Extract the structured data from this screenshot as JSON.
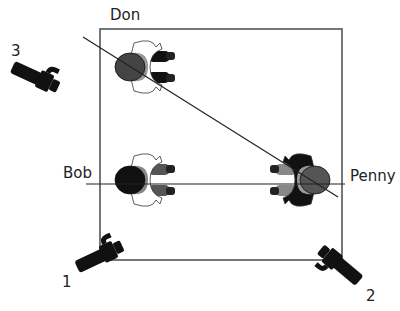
{
  "diagram": {
    "type": "camera-blocking-floorplan",
    "stage": {
      "x": 100,
      "y": 29,
      "width": 242,
      "height": 231,
      "stroke": "#555555"
    },
    "actors": [
      {
        "name": "Don",
        "label_x": 110,
        "label_y": 8,
        "cx": 140,
        "cy": 67,
        "facing": "right",
        "hair": "#444444",
        "shirt": "#ffffff",
        "pants": "#111111",
        "shoulder": "#999999"
      },
      {
        "name": "Bob",
        "label_x": 63,
        "label_y": 166,
        "cx": 140,
        "cy": 180,
        "facing": "right",
        "hair": "#111111",
        "shirt": "#ffffff",
        "pants": "#555555",
        "shoulder": "#888888"
      },
      {
        "name": "Penny",
        "label_x": 350,
        "label_y": 169,
        "cx": 305,
        "cy": 180,
        "facing": "left",
        "hair": "#555555",
        "shirt": "#111111",
        "pants": "#888888",
        "shoulder": "#999999"
      }
    ],
    "sightlines": [
      {
        "name": "don-penny-line",
        "x1": 83,
        "y1": 37,
        "x2": 338,
        "y2": 197
      },
      {
        "name": "bob-penny-line",
        "x1": 86,
        "y1": 184,
        "x2": 345,
        "y2": 184
      }
    ],
    "cameras": [
      {
        "number": "1",
        "label_x": 62,
        "label_y": 275,
        "cx": 104,
        "cy": 254,
        "angle": -25
      },
      {
        "number": "2",
        "label_x": 366,
        "label_y": 289,
        "cx": 336,
        "cy": 262,
        "angle": -140
      },
      {
        "number": "3",
        "label_x": 11,
        "label_y": 44,
        "cx": 40,
        "cy": 79,
        "angle": 25
      }
    ]
  }
}
